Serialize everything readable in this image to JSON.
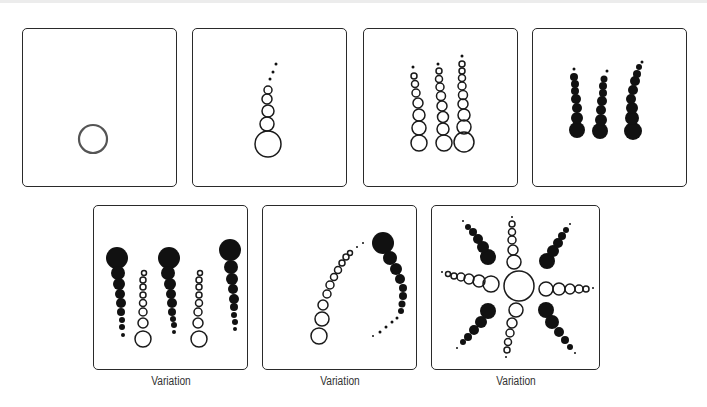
{
  "figure": {
    "colors": {
      "stroke": "#1a1a1a",
      "fill": "#111111",
      "border": "#2a2a2a",
      "caption": "#333333"
    }
  },
  "steps": [
    {
      "id": "step-1",
      "box": [
        22,
        28,
        155,
        159
      ],
      "caption": "",
      "circles": [
        [
          70,
          110,
          14,
          0
        ]
      ]
    },
    {
      "id": "step-2",
      "box": [
        192,
        28,
        155,
        159
      ],
      "caption": "",
      "circles": [
        [
          75,
          115,
          13,
          0
        ],
        [
          74,
          95,
          7,
          0
        ],
        [
          75,
          82,
          6,
          0
        ],
        [
          74,
          70,
          5,
          0
        ],
        [
          75,
          61,
          4,
          0
        ],
        [
          77,
          50,
          1.5,
          1
        ],
        [
          80,
          43,
          1.5,
          1
        ],
        [
          83,
          35,
          1.5,
          1
        ]
      ]
    },
    {
      "id": "step-3",
      "box": [
        363,
        28,
        155,
        159
      ],
      "caption": "",
      "circles": [
        [
          55,
          114,
          8,
          0
        ],
        [
          55,
          99,
          7,
          0
        ],
        [
          55,
          86,
          6,
          0
        ],
        [
          54,
          74,
          5,
          0
        ],
        [
          52,
          64,
          4,
          0
        ],
        [
          51,
          55,
          3.5,
          0
        ],
        [
          50,
          47,
          3,
          0
        ],
        [
          49,
          38,
          1.5,
          1
        ],
        [
          80,
          114,
          8,
          0
        ],
        [
          79,
          100,
          6,
          0
        ],
        [
          79,
          88,
          5.5,
          0
        ],
        [
          78,
          77,
          5,
          0
        ],
        [
          77,
          67,
          4.5,
          0
        ],
        [
          76,
          58,
          4,
          0
        ],
        [
          75,
          50,
          3.5,
          0
        ],
        [
          75,
          42,
          3,
          0
        ],
        [
          74,
          35,
          1.5,
          1
        ],
        [
          100,
          113,
          10,
          0
        ],
        [
          100,
          98,
          7,
          0
        ],
        [
          100,
          86,
          6,
          0
        ],
        [
          99,
          75,
          5,
          0
        ],
        [
          99,
          66,
          4.5,
          0
        ],
        [
          98,
          57,
          4,
          0
        ],
        [
          98,
          49,
          3.5,
          0
        ],
        [
          98,
          42,
          3,
          0
        ],
        [
          98,
          35,
          3,
          0
        ],
        [
          98,
          27,
          1.5,
          1
        ]
      ]
    },
    {
      "id": "step-4",
      "box": [
        532,
        28,
        155,
        159
      ],
      "caption": "",
      "circles": [
        [
          44,
          101,
          8,
          1
        ],
        [
          44,
          89,
          6,
          1
        ],
        [
          44,
          79,
          5,
          1
        ],
        [
          43,
          70,
          5,
          1
        ],
        [
          42,
          62,
          4,
          1
        ],
        [
          42,
          55,
          4,
          1
        ],
        [
          41,
          48,
          4,
          1
        ],
        [
          41,
          40,
          1.5,
          1
        ],
        [
          67,
          102,
          8,
          1
        ],
        [
          68,
          91,
          6,
          1
        ],
        [
          68,
          81,
          5,
          1
        ],
        [
          69,
          72,
          5,
          1
        ],
        [
          70,
          64,
          4,
          1
        ],
        [
          70,
          57,
          4,
          1
        ],
        [
          71,
          50,
          3.5,
          1
        ],
        [
          74,
          42,
          1.5,
          1
        ],
        [
          100,
          102,
          9,
          1
        ],
        [
          99,
          89,
          7,
          1
        ],
        [
          99,
          79,
          6,
          1
        ],
        [
          98,
          70,
          5,
          1
        ],
        [
          100,
          61,
          5,
          1
        ],
        [
          102,
          52,
          5,
          1
        ],
        [
          104,
          45,
          4,
          1
        ],
        [
          106,
          38,
          3,
          1
        ],
        [
          109,
          33,
          1.5,
          1
        ]
      ]
    },
    {
      "id": "variation-1",
      "box": [
        93,
        205,
        155,
        165
      ],
      "caption": "Variation",
      "circles": [
        [
          23,
          52,
          11,
          1
        ],
        [
          24,
          67,
          7,
          1
        ],
        [
          25,
          78,
          6,
          1
        ],
        [
          26,
          88,
          5,
          1
        ],
        [
          27,
          97,
          5,
          1
        ],
        [
          27,
          106,
          4,
          1
        ],
        [
          28,
          114,
          3,
          1
        ],
        [
          28,
          121,
          3,
          1
        ],
        [
          29,
          129,
          2,
          1
        ],
        [
          75,
          52,
          11,
          1
        ],
        [
          74,
          67,
          7,
          1
        ],
        [
          76,
          78,
          6,
          1
        ],
        [
          77,
          88,
          5,
          1
        ],
        [
          78,
          97,
          5,
          1
        ],
        [
          78,
          106,
          4,
          1
        ],
        [
          79,
          113,
          3,
          1
        ],
        [
          80,
          119,
          3,
          1
        ],
        [
          80,
          126,
          2,
          1
        ],
        [
          136,
          44,
          11,
          1
        ],
        [
          137,
          61,
          7,
          1
        ],
        [
          138,
          73,
          6,
          1
        ],
        [
          139,
          83,
          5,
          1
        ],
        [
          140,
          93,
          5,
          1
        ],
        [
          140,
          101,
          4,
          1
        ],
        [
          140,
          109,
          3,
          1
        ],
        [
          141,
          116,
          3,
          1
        ],
        [
          141,
          123,
          2,
          1
        ],
        [
          49,
          133,
          8,
          0
        ],
        [
          49,
          117,
          5,
          0
        ],
        [
          49,
          106,
          4,
          0
        ],
        [
          49,
          97,
          3.5,
          0
        ],
        [
          49,
          89,
          3,
          0
        ],
        [
          49,
          81,
          3,
          0
        ],
        [
          49,
          74,
          3,
          0
        ],
        [
          50,
          67,
          2.5,
          0
        ],
        [
          105,
          133,
          8,
          0
        ],
        [
          104,
          117,
          5,
          0
        ],
        [
          104,
          106,
          4,
          0
        ],
        [
          105,
          97,
          3.5,
          0
        ],
        [
          105,
          89,
          3,
          0
        ],
        [
          105,
          81,
          3,
          0
        ],
        [
          105,
          74,
          3,
          0
        ],
        [
          106,
          67,
          2.5,
          0
        ]
      ]
    },
    {
      "id": "variation-2",
      "box": [
        262,
        205,
        155,
        165
      ],
      "caption": "Variation",
      "circles": [
        [
          56,
          130,
          8,
          0
        ],
        [
          59,
          113,
          7,
          0
        ],
        [
          60,
          99,
          5,
          0
        ],
        [
          64,
          88,
          4,
          0
        ],
        [
          67,
          79,
          4,
          0
        ],
        [
          71,
          71,
          3.5,
          0
        ],
        [
          75,
          64,
          3.5,
          0
        ],
        [
          79,
          57,
          3,
          0
        ],
        [
          83,
          51,
          3,
          0
        ],
        [
          87,
          47,
          2.5,
          0
        ],
        [
          94,
          41,
          1,
          1
        ],
        [
          100,
          37,
          1,
          1
        ],
        [
          120,
          37,
          11,
          1
        ],
        [
          127,
          52,
          7,
          1
        ],
        [
          133,
          63,
          6,
          1
        ],
        [
          137,
          73,
          5,
          1
        ],
        [
          140,
          82,
          4,
          1
        ],
        [
          140,
          90,
          4,
          1
        ],
        [
          139,
          98,
          3.5,
          1
        ],
        [
          138,
          105,
          3,
          1
        ],
        [
          134,
          112,
          1.5,
          1
        ],
        [
          129,
          116,
          1.5,
          1
        ],
        [
          123,
          121,
          1.5,
          1
        ],
        [
          117,
          126,
          1.5,
          1
        ],
        [
          110,
          130,
          1,
          1
        ]
      ]
    },
    {
      "id": "variation-3",
      "box": [
        431,
        205,
        169,
        165
      ],
      "caption": "Variation",
      "circles": [
        [
          87,
          80,
          15,
          0
        ],
        [
          82,
          56,
          7,
          0
        ],
        [
          81,
          44,
          5,
          0
        ],
        [
          80,
          34,
          4,
          0
        ],
        [
          80,
          26,
          3.5,
          0
        ],
        [
          80,
          18,
          3,
          0
        ],
        [
          80,
          11,
          1,
          1
        ],
        [
          84,
          104,
          7,
          0
        ],
        [
          80,
          117,
          5,
          0
        ],
        [
          78,
          127,
          4,
          0
        ],
        [
          76,
          136,
          3.5,
          0
        ],
        [
          75,
          144,
          3,
          0
        ],
        [
          74,
          151,
          1,
          1
        ],
        [
          114,
          83,
          7,
          0
        ],
        [
          127,
          83,
          6,
          0
        ],
        [
          138,
          83,
          5,
          0
        ],
        [
          147,
          83,
          4,
          0
        ],
        [
          154,
          83,
          3,
          0
        ],
        [
          161,
          82,
          1,
          1
        ],
        [
          59,
          78,
          8,
          0
        ],
        [
          47,
          75,
          6,
          0
        ],
        [
          37,
          73,
          5,
          0
        ],
        [
          29,
          71,
          4,
          0
        ],
        [
          22,
          70,
          3,
          0
        ],
        [
          16,
          68,
          2.5,
          0
        ],
        [
          10,
          66,
          1,
          1
        ],
        [
          56,
          51,
          8,
          1
        ],
        [
          51,
          41,
          6,
          1
        ],
        [
          46,
          33,
          5,
          1
        ],
        [
          41,
          26,
          4,
          1
        ],
        [
          36,
          21,
          3,
          1
        ],
        [
          31,
          15,
          1,
          1
        ],
        [
          115,
          55,
          8,
          1
        ],
        [
          121,
          45,
          6,
          1
        ],
        [
          126,
          37,
          5,
          1
        ],
        [
          130,
          30,
          4,
          1
        ],
        [
          134,
          24,
          3,
          1
        ],
        [
          138,
          18,
          1,
          1
        ],
        [
          56,
          105,
          8,
          1
        ],
        [
          49,
          116,
          6,
          1
        ],
        [
          42,
          124,
          5,
          1
        ],
        [
          36,
          131,
          4,
          1
        ],
        [
          31,
          136,
          3,
          1
        ],
        [
          25,
          142,
          1,
          1
        ],
        [
          114,
          104,
          8,
          1
        ],
        [
          120,
          116,
          7,
          1
        ],
        [
          127,
          126,
          5,
          1
        ],
        [
          133,
          134,
          4,
          1
        ],
        [
          138,
          141,
          3,
          1
        ],
        [
          143,
          147,
          1,
          1
        ]
      ]
    }
  ]
}
